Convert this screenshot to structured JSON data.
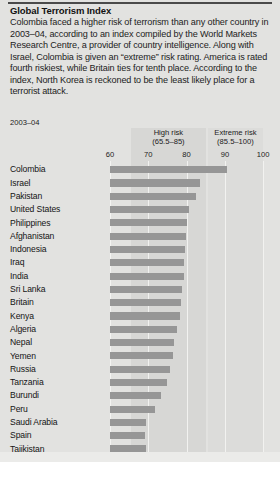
{
  "article": {
    "title": "Global Terrorism Index",
    "body": "Colombia faced a higher risk of terrorism than any other country in 2003–04, according to an index compiled by the World Markets Research Centre, a provider of country intelligence. Along with Israel, Colombia is given an “extreme” risk rating. America is rated fourth riskiest, while Britain ties for tenth place. According to the index, North Korea is reckoned to be the least likely place for a terrorist attack."
  },
  "chart_data": {
    "type": "bar",
    "orientation": "horizontal",
    "title": "Global Terrorism Index",
    "period_label": "2003–04",
    "xlabel": "",
    "ylabel": "",
    "xlim": [
      60,
      100
    ],
    "ticks": [
      60,
      70,
      80,
      90,
      100
    ],
    "grid": true,
    "bar_color": "#969696",
    "plot_background": "#e2e2e0",
    "bands": [
      {
        "name": "High risk",
        "range_label": "(65.5–85)",
        "from": 65.5,
        "to": 85,
        "color": "#d7d7d5"
      },
      {
        "name": "Extreme risk",
        "range_label": "(85.5–100)",
        "from": 85.5,
        "to": 100,
        "color": "#dcdcda"
      }
    ],
    "categories": [
      "Colombia",
      "Israel",
      "Pakistan",
      "United States",
      "Philippines",
      "Afghanistan",
      "Indonesia",
      "Iraq",
      "India",
      "Sri Lanka",
      "Britain",
      "Kenya",
      "Algeria",
      "Nepal",
      "Yemen",
      "Russia",
      "Tanzania",
      "Burundi",
      "Peru",
      "Saudi Arabia",
      "Spain",
      "Tajikistan"
    ],
    "values": [
      90.5,
      83.4,
      82.4,
      80.6,
      80.1,
      79.9,
      79.5,
      79.4,
      79.2,
      78.9,
      78.6,
      78.3,
      77.5,
      76.8,
      76.4,
      75.6,
      74.9,
      73.4,
      71.8,
      69.4,
      69.1,
      69.4
    ]
  }
}
